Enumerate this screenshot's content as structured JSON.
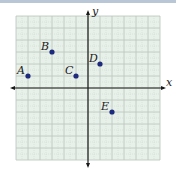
{
  "chart_data": {
    "type": "scatter",
    "title": "",
    "xlabel": "x",
    "ylabel": "y",
    "xlim": [
      -6,
      6
    ],
    "ylim": [
      -6,
      6
    ],
    "grid": true,
    "points": [
      {
        "label": "A",
        "x": -5,
        "y": 1
      },
      {
        "label": "B",
        "x": -3,
        "y": 3
      },
      {
        "label": "C",
        "x": -1,
        "y": 1
      },
      {
        "label": "D",
        "x": 1,
        "y": 2
      },
      {
        "label": "E",
        "x": 2,
        "y": -2
      }
    ]
  },
  "axes": {
    "x_label": "x",
    "y_label": "y"
  },
  "colors": {
    "grid_bg": "#e8f0ea",
    "grid_major": "#b7c4bb",
    "grid_minor": "#cfdad2",
    "axis": "#1a1a1a",
    "point": "#1e2b7c"
  }
}
